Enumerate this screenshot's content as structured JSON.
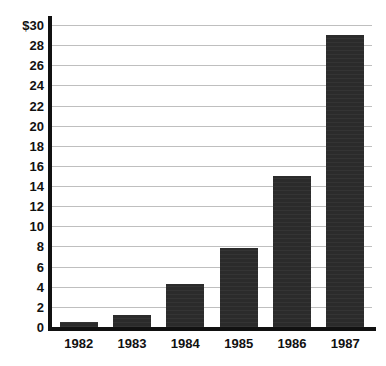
{
  "chart_data": {
    "type": "bar",
    "title": "",
    "subtitle": "",
    "xlabel": "",
    "ylabel": "",
    "categories": [
      "1982",
      "1983",
      "1984",
      "1985",
      "1986",
      "1987"
    ],
    "values": [
      0.5,
      1.2,
      4.3,
      7.8,
      15.0,
      29.0
    ],
    "series": [
      {
        "name": "",
        "values": [
          0.5,
          1.2,
          4.3,
          7.8,
          15.0,
          29.0
        ]
      }
    ],
    "ylim": [
      0,
      30
    ],
    "ytick_step": 2,
    "ytick_labels": [
      "$30",
      "28",
      "26",
      "24",
      "22",
      "20",
      "18",
      "16",
      "14",
      "12",
      "10",
      "8",
      "6",
      "4",
      "2",
      "0"
    ],
    "ytick_values": [
      30,
      28,
      26,
      24,
      22,
      20,
      18,
      16,
      14,
      12,
      10,
      8,
      6,
      4,
      2,
      0
    ],
    "xtick_labels": [
      "1982",
      "1983",
      "1984",
      "1985",
      "1986",
      "1987"
    ],
    "grid": true,
    "grid_axis": "y",
    "legend": false,
    "legend_position": "none",
    "annotations": [],
    "colors": {
      "bar_fill": "#2b2b2b",
      "axis": "#111111",
      "gridline": "#bfbfbf",
      "background": "#ffffff",
      "text": "#111111"
    }
  }
}
